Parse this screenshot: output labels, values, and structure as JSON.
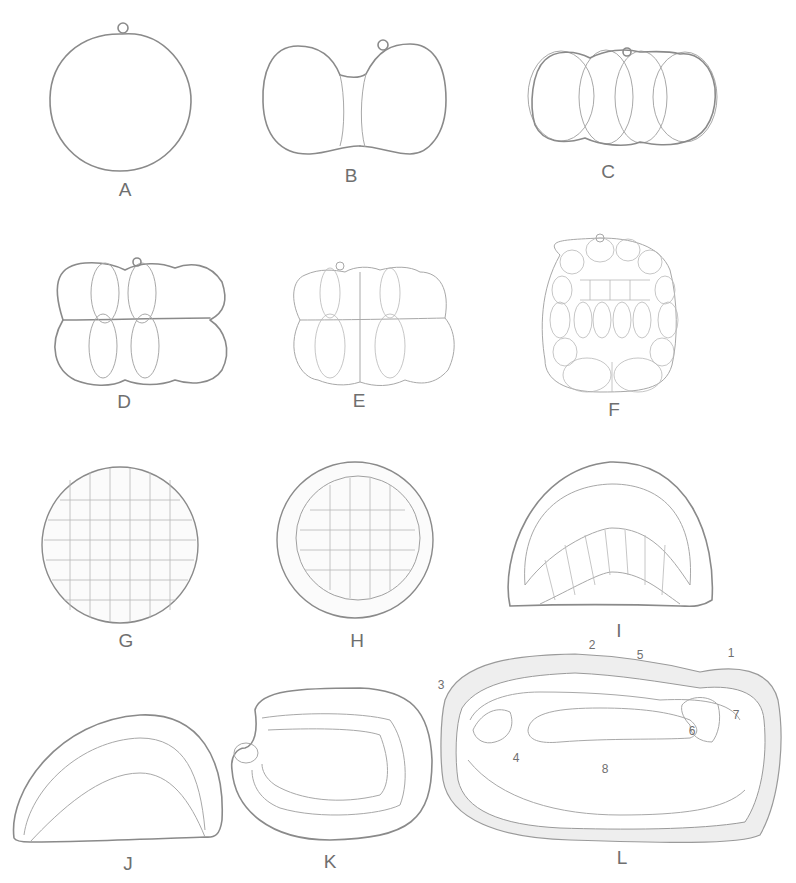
{
  "figure": {
    "panels": [
      {
        "id": "A",
        "label": "A",
        "stage": "one-cell egg with polar body"
      },
      {
        "id": "B",
        "label": "B",
        "stage": "two-cell stage"
      },
      {
        "id": "C",
        "label": "C",
        "stage": "four-cell stage"
      },
      {
        "id": "D",
        "label": "D",
        "stage": "eight-cell stage"
      },
      {
        "id": "E",
        "label": "E",
        "stage": "sixteen-cell stage"
      },
      {
        "id": "F",
        "label": "F",
        "stage": "morula (section)"
      },
      {
        "id": "G",
        "label": "G",
        "stage": "blastula (surface)"
      },
      {
        "id": "H",
        "label": "H",
        "stage": "blastula (section)"
      },
      {
        "id": "I",
        "label": "I",
        "stage": "early gastrula (invagination)"
      },
      {
        "id": "J",
        "label": "J",
        "stage": "gastrula"
      },
      {
        "id": "K",
        "label": "K",
        "stage": "late gastrula with blastopore"
      },
      {
        "id": "L",
        "label": "L",
        "stage": "later embryo section with numbered structures"
      }
    ],
    "annotations_L": [
      {
        "n": "1",
        "x": 731,
        "y": 653
      },
      {
        "n": "2",
        "x": 592,
        "y": 640
      },
      {
        "n": "3",
        "x": 441,
        "y": 682
      },
      {
        "n": "4",
        "x": 516,
        "y": 747
      },
      {
        "n": "5",
        "x": 640,
        "y": 645
      },
      {
        "n": "6",
        "x": 692,
        "y": 727
      },
      {
        "n": "7",
        "x": 736,
        "y": 711
      },
      {
        "n": "8",
        "x": 605,
        "y": 768
      }
    ]
  }
}
